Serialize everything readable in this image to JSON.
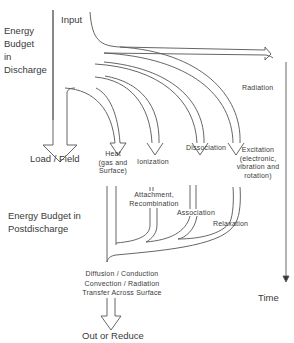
{
  "diagram": {
    "sections": {
      "discharge": "Energy\nBudget\nin\nDischarge",
      "postdischarge": "Energy Budget in\nPostdischarge"
    },
    "nodes": {
      "input": "Input",
      "radiation": "Radiation",
      "load_field": "Load / Field",
      "heat": "Heat\n(gas and\nSurface)",
      "ionization": "Ionization",
      "dissociation": "Dissociation",
      "excitation": "Excitation\n(electronic,\nvibration and\nrotation)",
      "attachment": "Attachment,\nRecombination",
      "association": "Association",
      "relaxation": "Relaxation",
      "transfer": "Diffusion  /  Conduction\nConvection  /  Radiation\nTransfer  Across  Surface",
      "out": "Out or Reduce",
      "time": "Time"
    },
    "flows": [
      {
        "from": "Input",
        "to": "Radiation"
      },
      {
        "from": "Input",
        "to": "Load / Field"
      },
      {
        "from": "Input",
        "to": "Heat (gas and Surface)"
      },
      {
        "from": "Input",
        "to": "Ionization"
      },
      {
        "from": "Input",
        "to": "Dissociation"
      },
      {
        "from": "Input",
        "to": "Excitation"
      },
      {
        "from": "Ionization",
        "to": "Attachment, Recombination"
      },
      {
        "from": "Dissociation",
        "to": "Association"
      },
      {
        "from": "Excitation",
        "to": "Relaxation"
      },
      {
        "from": "Attachment, Recombination",
        "to": "Heat"
      },
      {
        "from": "Association",
        "to": "Heat"
      },
      {
        "from": "Relaxation",
        "to": "Heat"
      },
      {
        "from": "Heat",
        "to": "Diffusion / Conduction / Convection / Radiation / Transfer Across Surface"
      },
      {
        "from": "Transfer",
        "to": "Out or Reduce"
      }
    ]
  }
}
